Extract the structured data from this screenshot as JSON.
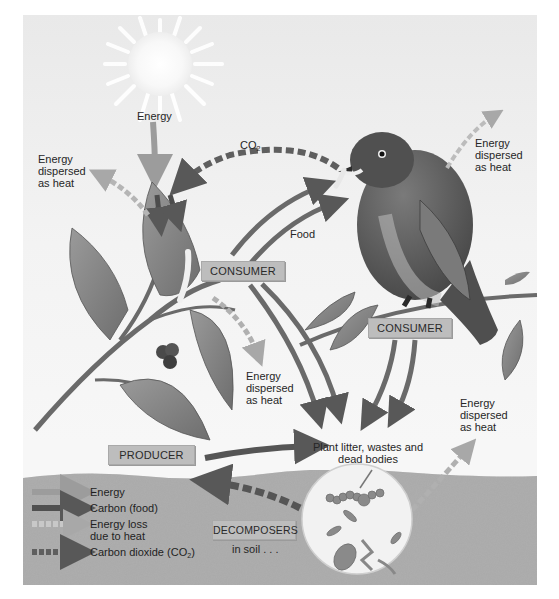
{
  "labels": {
    "sun_energy": "Energy",
    "co2": "CO",
    "co2_sub": "2",
    "food": "Food",
    "heat_top_left": [
      "Energy",
      "dispersed",
      "as heat"
    ],
    "heat_top_right": [
      "Energy",
      "dispersed",
      "as heat"
    ],
    "heat_middle": [
      "Energy",
      "dispersed",
      "as heat"
    ],
    "heat_bottom_right": [
      "Energy",
      "dispersed",
      "as heat"
    ],
    "litter": [
      "Plant litter, wastes and",
      "dead bodies"
    ],
    "in_soil": "in soil . . ."
  },
  "boxes": {
    "consumer_caterpillar": "CONSUMER",
    "consumer_bird": "CONSUMER",
    "producer": "PRODUCER",
    "decomposers": "DECOMPOSERS"
  },
  "legend": [
    {
      "label": "Energy",
      "style": "solid-light"
    },
    {
      "label": "Carbon (food)",
      "style": "solid-dark"
    },
    {
      "label": "Energy loss",
      "label2": "due to heat",
      "style": "dashed-light"
    },
    {
      "label": "Carbon dioxide (CO",
      "sub": "2",
      "label_end": ")",
      "style": "dashed-dark"
    }
  ],
  "colors": {
    "energy_arrow": "#9a9a9a",
    "carbon_arrow": "#5a5a5a",
    "heat_arrow": "#c4c4c4",
    "co2_arrow": "#5f5f5f",
    "label_box": "#bdbdbd",
    "soil": "#a3a3a3"
  }
}
